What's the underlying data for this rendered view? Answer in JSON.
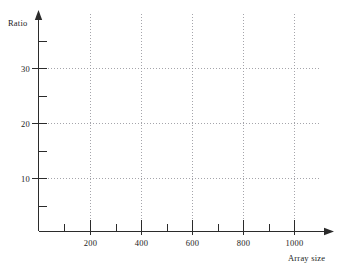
{
  "chart_data": {
    "type": "line",
    "title": "",
    "subtitle": "",
    "xlabel": "Array size",
    "ylabel": "Ratio",
    "xlim": [
      0,
      1120
    ],
    "ylim": [
      0,
      36
    ],
    "grid": true,
    "legend": null,
    "legend_position": "none",
    "x_major_ticks": [
      200,
      400,
      600,
      800,
      1000
    ],
    "x_minor_ticks": [
      100,
      300,
      500,
      700,
      900,
      1100
    ],
    "x_tick_labels": [
      "200",
      "400",
      "600",
      "800",
      "1000"
    ],
    "y_major_ticks": [
      10,
      20,
      30
    ],
    "y_minor_ticks": [
      5,
      15,
      25,
      35
    ],
    "y_tick_labels": [
      "10",
      "20",
      "30"
    ],
    "series": [],
    "values": [],
    "categories": [],
    "annotations": [],
    "note": "empty axes; no data series plotted"
  },
  "axes": {
    "y_title": "Ratio",
    "x_title": "Array size",
    "y_labels": [
      "30",
      "20",
      "10"
    ],
    "x_labels": [
      "200",
      "400",
      "600",
      "800",
      "1000"
    ]
  },
  "colors": {
    "axis": "#2b2b2b",
    "grid": "#8e8e96",
    "text": "#1c1c1c",
    "background": "#ffffff"
  }
}
